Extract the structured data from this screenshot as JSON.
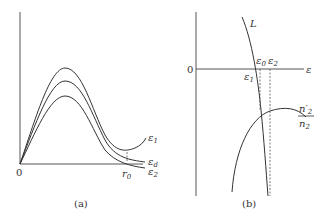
{
  "panel_a": {
    "caption": "(a)",
    "origin_label": "0",
    "x_marker": {
      "symbol": "r",
      "sub": "0"
    },
    "curves": [
      {
        "symbol": "ε",
        "sub": "1"
      },
      {
        "symbol": "ε",
        "sub": "d"
      },
      {
        "symbol": "ε",
        "sub": "2"
      }
    ]
  },
  "panel_b": {
    "caption": "(b)",
    "origin_label": "0",
    "x_axis_label": "ε",
    "curve_L_label": "L",
    "points": [
      {
        "symbol": "ε",
        "sub": "0"
      },
      {
        "symbol": "ε",
        "sub": "2"
      },
      {
        "symbol": "ε",
        "sub": "1"
      }
    ],
    "ratio_label": {
      "numerator": "n′",
      "numerator_sub": "2",
      "denominator": "n",
      "denominator_sub": "2"
    }
  }
}
